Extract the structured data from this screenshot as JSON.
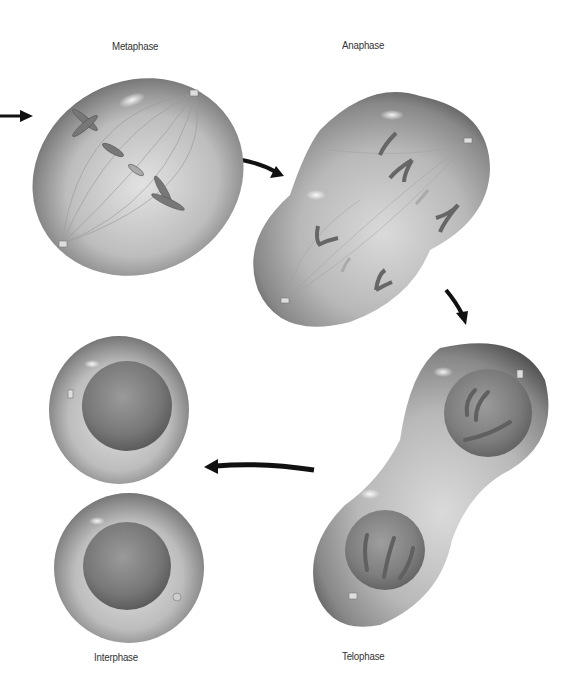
{
  "diagram": {
    "stages": [
      {
        "id": "metaphase",
        "label": "Metaphase"
      },
      {
        "id": "anaphase",
        "label": "Anaphase"
      },
      {
        "id": "telophase",
        "label": "Telophase"
      },
      {
        "id": "interphase",
        "label": "Interphase"
      }
    ],
    "flow": [
      "Metaphase",
      "Anaphase",
      "Telophase",
      "Interphase"
    ],
    "colors": {
      "cell_dark": "#4a4a4a",
      "cell_light": "#d8d8d8",
      "nucleus": "#6e6e6e",
      "chromosome": "#5a5a5a",
      "arrow": "#111111",
      "label": "#333333"
    }
  }
}
